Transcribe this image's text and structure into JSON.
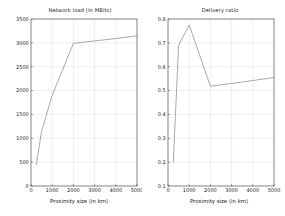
{
  "figure": {
    "background": "#ffffff",
    "line_color": "#8c8c8c",
    "axis_color": "#4d4d4d",
    "grid_color": "#d9d9de"
  },
  "chart_data": [
    {
      "type": "line",
      "title": "Network load (in MBits)",
      "xlabel": "Proximity size (in km)",
      "ylabel": "",
      "xlim": [
        0,
        5000
      ],
      "ylim": [
        0,
        3500
      ],
      "xticks": [
        0,
        1000,
        2000,
        3000,
        4000,
        5000
      ],
      "xtick_labels": [
        "0",
        "1000",
        "2000",
        "3000",
        "4000",
        "5000"
      ],
      "yticks": [
        0,
        500,
        1000,
        1500,
        2000,
        2500,
        3000,
        3500
      ],
      "ytick_labels": [
        "0",
        "500",
        "1000",
        "1500",
        "2000",
        "2500",
        "3000",
        "3500"
      ],
      "grid": true,
      "legend": false,
      "series": [
        {
          "name": "Network load",
          "x": [
            250,
            500,
            1000,
            2000,
            3000,
            4000,
            5000
          ],
          "y": [
            450,
            1150,
            1900,
            2990,
            3040,
            3090,
            3150
          ]
        }
      ]
    },
    {
      "type": "line",
      "title": "Delivery ratio",
      "xlabel": "Proximity size (in km)",
      "ylabel": "",
      "xlim": [
        0,
        5000
      ],
      "ylim": [
        0.1,
        0.8
      ],
      "xticks": [
        0,
        1000,
        2000,
        3000,
        4000,
        5000
      ],
      "xtick_labels": [
        "0",
        "1000",
        "2000",
        "3000",
        "4000",
        "5000"
      ],
      "yticks": [
        0.1,
        0.2,
        0.3,
        0.4,
        0.5,
        0.6,
        0.7,
        0.8
      ],
      "ytick_labels": [
        "0.1",
        "0.2",
        "0.3",
        "0.4",
        "0.5",
        "0.6",
        "0.7",
        "0.8"
      ],
      "grid": true,
      "legend": false,
      "series": [
        {
          "name": "Delivery ratio",
          "x": [
            250,
            500,
            1000,
            2000,
            3000,
            4000,
            5000
          ],
          "y": [
            0.2,
            0.69,
            0.775,
            0.518,
            0.53,
            0.542,
            0.555
          ]
        }
      ]
    }
  ]
}
